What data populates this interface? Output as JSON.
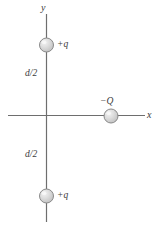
{
  "figure": {
    "kind": "physics-diagram",
    "width": 156,
    "height": 228,
    "background": "#ffffff"
  },
  "axes": {
    "y": {
      "label": "y",
      "x": 46,
      "y_start": 14,
      "y_end": 222,
      "color": "#6b6b6b"
    },
    "x": {
      "label": "x",
      "y": 115,
      "x_start": 8,
      "x_end": 145,
      "color": "#6b6b6b"
    }
  },
  "charges": [
    {
      "id": "charge-top",
      "label": "+q",
      "sign": "positive",
      "cx": 46,
      "cy": 45,
      "r": 7,
      "fill": "#d5d5d5",
      "stroke": "#8a8a8a"
    },
    {
      "id": "charge-negative",
      "label": "−Q",
      "sign": "negative",
      "cx": 111,
      "cy": 116,
      "r": 7,
      "fill": "#d5d5d5",
      "stroke": "#8a8a8a"
    },
    {
      "id": "charge-bottom",
      "label": "+q",
      "sign": "positive",
      "cx": 46,
      "cy": 196,
      "r": 7,
      "fill": "#d5d5d5",
      "stroke": "#8a8a8a"
    }
  ],
  "distances": [
    {
      "id": "distance-top",
      "label": "d/2"
    },
    {
      "id": "distance-bottom",
      "label": "d/2"
    }
  ]
}
